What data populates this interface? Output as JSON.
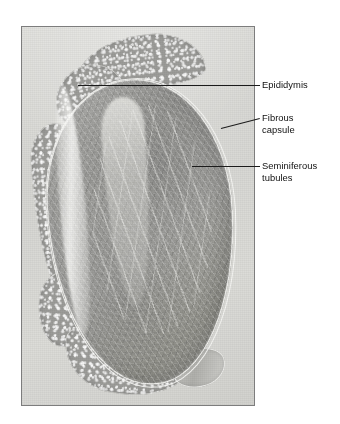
{
  "figure": {
    "type": "histology-micrograph",
    "background_color": "#ffffff",
    "plate_border_color": "#7d7d7d"
  },
  "micrograph": {
    "alt": "Low-power light micrograph of a sectioned testis surrounded by the epididymis",
    "frame": {
      "x": 21,
      "y": 26,
      "width": 234,
      "height": 380
    },
    "structures": [
      {
        "name": "epididymis-head",
        "description": "Mottled tubular mass along the upper border"
      },
      {
        "name": "epididymis-body",
        "description": "Mottled tubular mass along the left border"
      },
      {
        "name": "epididymis-tail",
        "description": "Mottled tubular mass along the lower border"
      },
      {
        "name": "vas-deferens",
        "description": "Duct profile at lower right of the tail"
      },
      {
        "name": "testis-body",
        "description": "Large ovoid parenchyma filled with seminiferous tubules"
      },
      {
        "name": "fibrous-capsule",
        "description": "Bright tunica albuginea rim encircling the testis"
      },
      {
        "name": "mediastinum",
        "description": "Pale fibrous streaks converging in the centre"
      }
    ]
  },
  "annotations": [
    {
      "id": "epididymis",
      "label": "Epididymis",
      "text_color": "#101010",
      "leader": {
        "x1": 78,
        "y1": 85,
        "x2": 260,
        "y2": 85
      },
      "text_position": {
        "x": 262,
        "y": 79
      }
    },
    {
      "id": "fibrous-capsule",
      "label": "Fibrous\ncapsule",
      "text_color": "#101010",
      "leader": {
        "x1": 221,
        "y1": 128,
        "x2": 260,
        "y2": 118
      },
      "text_position": {
        "x": 262,
        "y": 112
      }
    },
    {
      "id": "seminiferous-tubules",
      "label": "Seminiferous\ntubules",
      "text_color": "#101010",
      "leader": {
        "x1": 192,
        "y1": 166,
        "x2": 260,
        "y2": 166
      },
      "text_position": {
        "x": 262,
        "y": 160
      }
    }
  ]
}
